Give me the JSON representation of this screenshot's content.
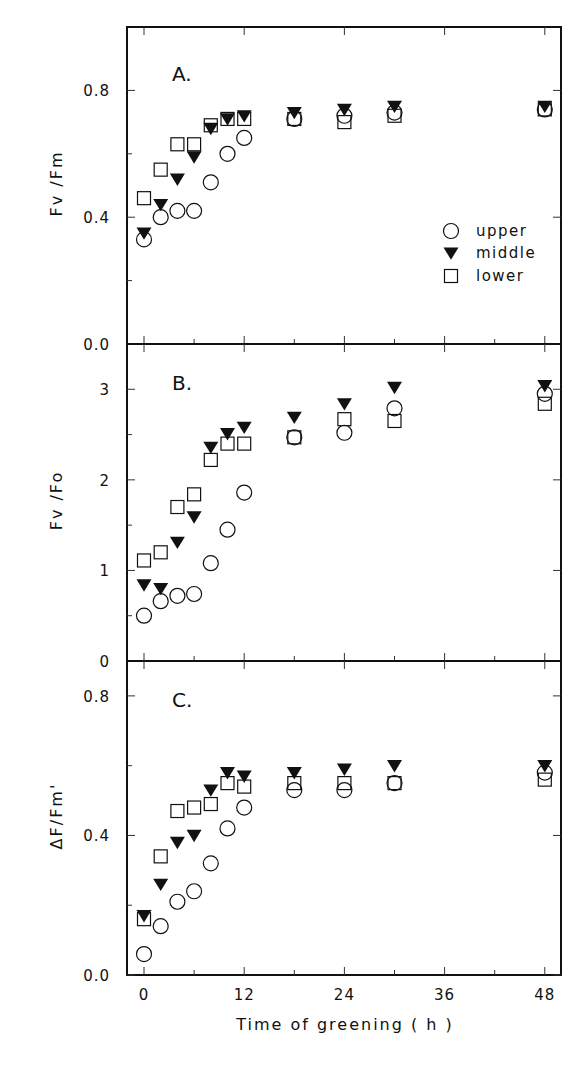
{
  "figure": {
    "xlabel": "Time of greening ( h )",
    "xticks": [
      0,
      12,
      24,
      36,
      48
    ],
    "xminor": [
      6,
      18,
      30,
      42
    ]
  },
  "legend": {
    "items": [
      {
        "label": "upper",
        "marker": "circle"
      },
      {
        "label": "middle",
        "marker": "triangle-down-filled"
      },
      {
        "label": "lower",
        "marker": "square"
      }
    ]
  },
  "colors": {
    "ink": "#111111",
    "background": "#ffffff"
  },
  "chart_data": [
    {
      "type": "scatter",
      "panel": "A.",
      "title": "",
      "xlabel": "Time of greening ( h )",
      "ylabel": "Fv /Fm",
      "ylim": [
        0.0,
        1.0
      ],
      "yticks": [
        0.0,
        0.4,
        0.8
      ],
      "ytick_labels": [
        "0.0",
        "0.4",
        "0.8"
      ],
      "yminor": [
        0.2,
        0.6
      ],
      "xlim": [
        -2,
        50
      ],
      "grid": false,
      "legend_position": "right-lower",
      "x": [
        0,
        2,
        4,
        6,
        8,
        10,
        12,
        18,
        24,
        30,
        48
      ],
      "series": [
        {
          "name": "upper",
          "marker": "circle",
          "values": [
            0.33,
            0.4,
            0.42,
            0.42,
            0.51,
            0.6,
            0.65,
            0.71,
            0.72,
            0.73,
            0.74
          ]
        },
        {
          "name": "middle",
          "marker": "triangle",
          "values": [
            0.35,
            0.44,
            0.52,
            0.59,
            0.68,
            0.71,
            0.72,
            0.73,
            0.74,
            0.75,
            0.75
          ]
        },
        {
          "name": "lower",
          "marker": "square",
          "values": [
            0.46,
            0.55,
            0.63,
            0.63,
            0.69,
            0.71,
            0.71,
            0.71,
            0.7,
            0.72,
            0.74
          ]
        }
      ]
    },
    {
      "type": "scatter",
      "panel": "B.",
      "title": "",
      "xlabel": "Time of greening ( h )",
      "ylabel": "Fv /Fo",
      "ylim": [
        0,
        3.5
      ],
      "yticks": [
        0,
        1,
        2,
        3
      ],
      "ytick_labels": [
        "0",
        "1",
        "2",
        "3"
      ],
      "yminor": [
        0.5,
        1.5,
        2.5
      ],
      "xlim": [
        -2,
        50
      ],
      "grid": false,
      "x": [
        0,
        2,
        4,
        6,
        8,
        10,
        12,
        18,
        24,
        30,
        48
      ],
      "series": [
        {
          "name": "upper",
          "marker": "circle",
          "values": [
            0.5,
            0.66,
            0.72,
            0.74,
            1.08,
            1.45,
            1.86,
            2.47,
            2.52,
            2.79,
            2.95
          ]
        },
        {
          "name": "middle",
          "marker": "triangle",
          "values": [
            0.84,
            0.8,
            1.31,
            1.59,
            2.36,
            2.51,
            2.58,
            2.69,
            2.84,
            3.02,
            3.04
          ]
        },
        {
          "name": "lower",
          "marker": "square",
          "values": [
            1.11,
            1.2,
            1.7,
            1.84,
            2.22,
            2.4,
            2.4,
            2.47,
            2.67,
            2.65,
            2.84
          ]
        }
      ]
    },
    {
      "type": "scatter",
      "panel": "C.",
      "title": "",
      "xlabel": "Time of greening ( h )",
      "ylabel": "ΔF/Fm'",
      "ylim": [
        0.0,
        0.9
      ],
      "yticks": [
        0.0,
        0.4,
        0.8
      ],
      "ytick_labels": [
        "0.0",
        "0.4",
        "0.8"
      ],
      "yminor": [
        0.2,
        0.6
      ],
      "xlim": [
        -2,
        50
      ],
      "grid": false,
      "x": [
        0,
        2,
        4,
        6,
        8,
        10,
        12,
        18,
        24,
        30,
        48
      ],
      "series": [
        {
          "name": "upper",
          "marker": "circle",
          "values": [
            0.06,
            0.14,
            0.21,
            0.24,
            0.32,
            0.42,
            0.48,
            0.53,
            0.53,
            0.55,
            0.58
          ]
        },
        {
          "name": "middle",
          "marker": "triangle",
          "values": [
            0.17,
            0.26,
            0.38,
            0.4,
            0.53,
            0.58,
            0.57,
            0.58,
            0.59,
            0.6,
            0.6
          ]
        },
        {
          "name": "lower",
          "marker": "square",
          "values": [
            0.16,
            0.34,
            0.47,
            0.48,
            0.49,
            0.55,
            0.54,
            0.55,
            0.55,
            0.55,
            0.56
          ]
        }
      ]
    }
  ]
}
